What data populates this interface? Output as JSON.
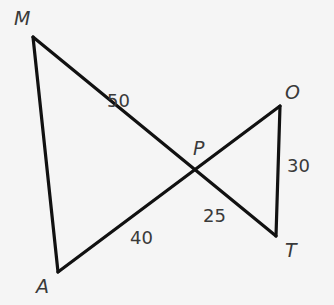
{
  "diagram": {
    "type": "geometry-figure",
    "vertices": {
      "M": {
        "label": "M",
        "x": 33,
        "y": 37
      },
      "P": {
        "label": "P",
        "x": 194,
        "y": 170
      },
      "O": {
        "label": "O",
        "x": 280,
        "y": 106
      },
      "T": {
        "label": "T",
        "x": 276,
        "y": 236
      },
      "A": {
        "label": "A",
        "x": 58,
        "y": 272
      }
    },
    "segments": [
      {
        "from": "M",
        "to": "T",
        "through": "P"
      },
      {
        "from": "A",
        "to": "O",
        "through": "P"
      },
      {
        "from": "M",
        "to": "A"
      },
      {
        "from": "O",
        "to": "T"
      }
    ],
    "lengths": {
      "MP": "50",
      "AP": "40",
      "PT": "25",
      "OT": "30"
    },
    "colors": {
      "line": "#111111",
      "text": "#3a3a3a",
      "background": "#f5f5f5"
    }
  }
}
